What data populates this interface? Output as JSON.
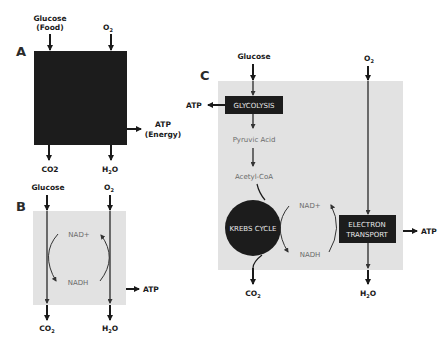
{
  "panels": {
    "A": {
      "letter": "A",
      "inputs": {
        "glucose": "Glucose",
        "glucose_note": "(Food)",
        "oxygen": "O",
        "oxygen_sub": "2"
      },
      "outputs": {
        "co2": "CO2",
        "water": "H",
        "water_sub": "2",
        "water_end": "O",
        "atp": "ATP",
        "atp_note": "(Energy)"
      }
    },
    "B": {
      "letter": "B",
      "inputs": {
        "glucose": "Glucose",
        "oxygen": "O",
        "oxygen_sub": "2"
      },
      "cycle": {
        "nad_plus": "NAD+",
        "nadh": "NADH"
      },
      "outputs": {
        "co2": "CO",
        "co2_sub": "2",
        "water": "H",
        "water_sub": "2",
        "water_end": "O",
        "atp": "ATP"
      }
    },
    "C": {
      "letter": "C",
      "inputs": {
        "glucose": "Glucose",
        "oxygen": "O",
        "oxygen_sub": "2"
      },
      "steps": {
        "glycolysis": "GLYCOLYSIS",
        "pyruvic_acid": "Pyruvic Acid",
        "acetyl_coa": "Acetyl-CoA",
        "krebs_cycle": "KREBS CYCLE",
        "electron_transport_1": "ELECTRON",
        "electron_transport_2": "TRANSPORT"
      },
      "cycle": {
        "nad_plus": "NAD+",
        "nadh": "NADH"
      },
      "outputs": {
        "atp_glycolysis": "ATP",
        "atp_electron": "ATP",
        "co2": "CO",
        "co2_sub": "2",
        "water": "H",
        "water_sub": "2",
        "water_end": "O"
      }
    }
  },
  "colors": {
    "box_dark": "#1c1c1c",
    "box_gray": "#e2e2e2",
    "arrow": "#1a1a1a",
    "text_gray": "#6a6a6a"
  }
}
